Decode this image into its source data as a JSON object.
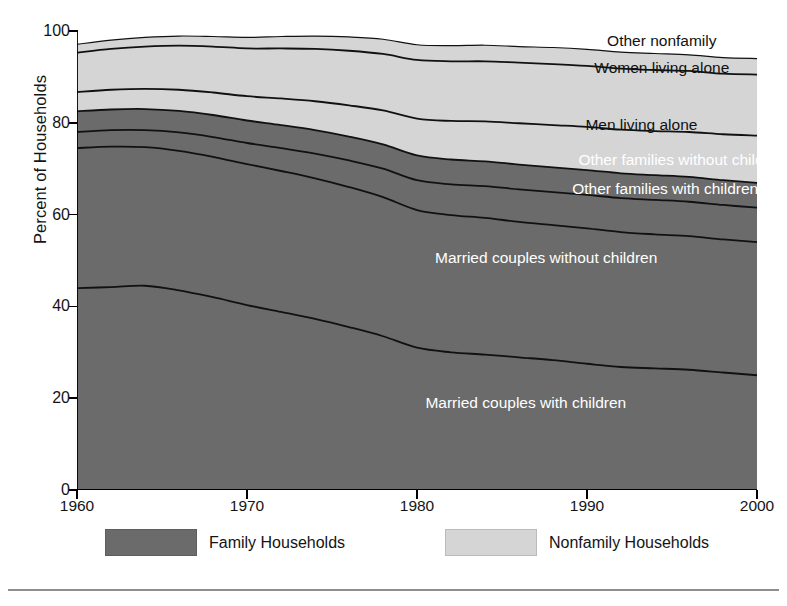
{
  "chart_data": {
    "type": "area",
    "title": "",
    "subtitle": "",
    "xlabel": "",
    "ylabel": "Percent of Households",
    "xlim": [
      1960,
      2000
    ],
    "ylim": [
      0,
      100
    ],
    "grid": false,
    "stacked": true,
    "normalized_to_100": true,
    "legend_position": "bottom",
    "x": [
      1960,
      1962,
      1964,
      1966,
      1968,
      1970,
      1972,
      1974,
      1976,
      1978,
      1980,
      1982,
      1984,
      1986,
      1988,
      1990,
      1992,
      1994,
      1996,
      1998,
      2000
    ],
    "xticks": [
      1960,
      1970,
      1980,
      1990,
      2000
    ],
    "yticks": [
      0,
      20,
      40,
      60,
      80,
      100
    ],
    "series": [
      {
        "name": "Married couples with children",
        "group": "Family Households",
        "color": "#6b6b6b",
        "values": [
          44.0,
          44.2,
          44.5,
          43.5,
          42.0,
          40.3,
          38.8,
          37.3,
          35.5,
          33.5,
          31.0,
          30.0,
          29.5,
          28.9,
          28.3,
          27.5,
          26.8,
          26.5,
          26.2,
          25.6,
          25.0
        ]
      },
      {
        "name": "Married couples without children",
        "group": "Family Households",
        "color": "#6b6b6b",
        "values": [
          30.5,
          30.6,
          30.2,
          30.4,
          30.6,
          30.7,
          30.7,
          30.6,
          30.5,
          30.3,
          30.0,
          29.9,
          29.8,
          29.5,
          29.4,
          29.5,
          29.4,
          29.2,
          29.1,
          29.0,
          29.0
        ]
      },
      {
        "name": "Other families with children",
        "group": "Family Households",
        "color": "#6b6b6b",
        "values": [
          3.5,
          3.6,
          3.7,
          4.0,
          4.3,
          4.6,
          5.0,
          5.4,
          5.8,
          6.2,
          6.5,
          6.7,
          6.9,
          7.1,
          7.2,
          7.3,
          7.4,
          7.5,
          7.5,
          7.5,
          7.5
        ]
      },
      {
        "name": "Other families without children",
        "group": "Family Households",
        "color": "#6b6b6b",
        "values": [
          4.5,
          4.5,
          4.6,
          4.7,
          4.8,
          4.9,
          5.0,
          5.1,
          5.2,
          5.3,
          5.4,
          5.4,
          5.4,
          5.4,
          5.4,
          5.4,
          5.4,
          5.4,
          5.4,
          5.4,
          5.4
        ]
      },
      {
        "name": "Men living alone",
        "group": "Nonfamily Households",
        "color": "#d5d5d5",
        "values": [
          4.2,
          4.3,
          4.4,
          4.6,
          4.9,
          5.3,
          5.8,
          6.3,
          6.8,
          7.4,
          8.0,
          8.4,
          8.7,
          9.0,
          9.2,
          9.4,
          9.5,
          9.6,
          9.8,
          10.0,
          10.3
        ]
      },
      {
        "name": "Women living alone",
        "group": "Nonfamily Households",
        "color": "#d5d5d5",
        "values": [
          8.6,
          8.9,
          9.2,
          9.6,
          10.0,
          10.4,
          10.9,
          11.4,
          11.9,
          12.3,
          12.8,
          13.0,
          13.1,
          13.2,
          13.3,
          13.3,
          13.3,
          13.3,
          13.3,
          13.2,
          13.3
        ]
      },
      {
        "name": "Other nonfamily",
        "group": "Nonfamily Households",
        "color": "#d5d5d5",
        "values": [
          1.8,
          1.9,
          2.0,
          2.1,
          2.2,
          2.4,
          2.6,
          2.8,
          3.0,
          3.2,
          3.3,
          3.4,
          3.5,
          3.5,
          3.6,
          3.6,
          3.6,
          3.6,
          3.5,
          3.5,
          3.5
        ]
      }
    ],
    "band_labels": [
      {
        "text": "Other nonfamily",
        "x_pct": 86.0,
        "y_value": 97.8,
        "text_color": "dark"
      },
      {
        "text": "Women living alone",
        "x_pct": 86.0,
        "y_value": 92.0,
        "text_color": "dark"
      },
      {
        "text": "Men living alone",
        "x_pct": 83.0,
        "y_value": 79.5,
        "text_color": "dark"
      },
      {
        "text": "Other families without children",
        "x_pct": 89.0,
        "y_value": 72.0,
        "text_color": "light"
      },
      {
        "text": "Other families with children",
        "x_pct": 86.5,
        "y_value": 65.5,
        "text_color": "light"
      },
      {
        "text": "Married couples without children",
        "x_pct": 69.0,
        "y_value": 50.5,
        "text_color": "light"
      },
      {
        "text": "Married couples with children",
        "x_pct": 66.0,
        "y_value": 19.0,
        "text_color": "light"
      }
    ],
    "legend": [
      {
        "label": "Family Households",
        "color": "#6b6b6b"
      },
      {
        "label": "Nonfamily Households",
        "color": "#d5d5d5"
      }
    ]
  }
}
